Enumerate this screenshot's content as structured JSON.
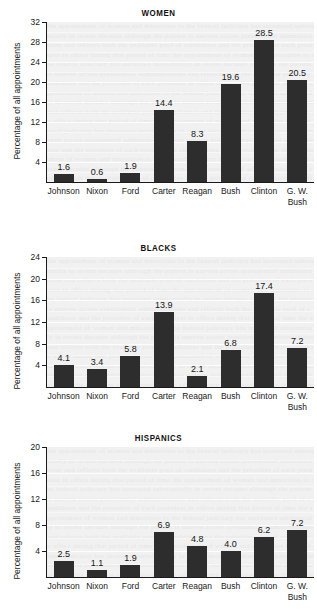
{
  "axis_label": "Percentage of all appointments",
  "bar_color": "#2d2d2d",
  "plot_bg": "#f1f1f1",
  "gridline_color": "#fdfdfd",
  "categories": [
    "Johnson",
    "Nixon",
    "Ford",
    "Carter",
    "Reagan",
    "Bush",
    "Clinton",
    "G. W. Bush"
  ],
  "category_lines": [
    [
      "Johnson"
    ],
    [
      "Nixon"
    ],
    [
      "Ford"
    ],
    [
      "Carter"
    ],
    [
      "Reagan"
    ],
    [
      "Bush"
    ],
    [
      "Clinton"
    ],
    [
      "G. W.",
      "Bush"
    ]
  ],
  "chart_data": [
    {
      "type": "bar",
      "title": "WOMEN",
      "xlabel": "",
      "ylabel": "Percentage of all appointments",
      "categories": [
        "Johnson",
        "Nixon",
        "Ford",
        "Carter",
        "Reagan",
        "Bush",
        "Clinton",
        "G. W. Bush"
      ],
      "values": [
        1.6,
        0.6,
        1.9,
        14.4,
        8.3,
        19.6,
        28.5,
        20.5
      ],
      "value_labels": [
        "1.6",
        "0.6",
        "1.9",
        "14.4",
        "8.3",
        "19.6",
        "28.5",
        "20.5"
      ],
      "yticks": [
        4,
        8,
        12,
        16,
        20,
        24,
        28,
        32
      ],
      "ytick_labels": [
        "4",
        "8",
        "12",
        "16",
        "20",
        "24",
        "28",
        "32"
      ],
      "ylim": [
        0,
        32
      ],
      "grid": true,
      "legend": "none"
    },
    {
      "type": "bar",
      "title": "BLACKS",
      "xlabel": "",
      "ylabel": "Percentage of all appointments",
      "categories": [
        "Johnson",
        "Nixon",
        "Ford",
        "Carter",
        "Reagan",
        "Bush",
        "Clinton",
        "G. W. Bush"
      ],
      "values": [
        4.1,
        3.4,
        5.8,
        13.9,
        2.1,
        6.8,
        17.4,
        7.2
      ],
      "value_labels": [
        "4.1",
        "3.4",
        "5.8",
        "13.9",
        "2.1",
        "6.8",
        "17.4",
        "7.2"
      ],
      "yticks": [
        4,
        8,
        12,
        16,
        20,
        24
      ],
      "ytick_labels": [
        "4",
        "8",
        "12",
        "16",
        "20",
        "24"
      ],
      "ylim": [
        0,
        24
      ],
      "grid": true,
      "legend": "none"
    },
    {
      "type": "bar",
      "title": "HISPANICS",
      "xlabel": "",
      "ylabel": "Percentage of all appointments",
      "categories": [
        "Johnson",
        "Nixon",
        "Ford",
        "Carter",
        "Reagan",
        "Bush",
        "Clinton",
        "G. W. Bush"
      ],
      "values": [
        2.5,
        1.1,
        1.9,
        6.9,
        4.8,
        4.0,
        6.2,
        7.2
      ],
      "value_labels": [
        "2.5",
        "1.1",
        "1.9",
        "6.9",
        "4.8",
        "4.0",
        "6.2",
        "7.2"
      ],
      "yticks": [
        4,
        8,
        12,
        16,
        20
      ],
      "ytick_labels": [
        "4",
        "8",
        "12",
        "16",
        "20"
      ],
      "ylim": [
        0,
        20
      ],
      "grid": true,
      "legend": "none"
    }
  ]
}
